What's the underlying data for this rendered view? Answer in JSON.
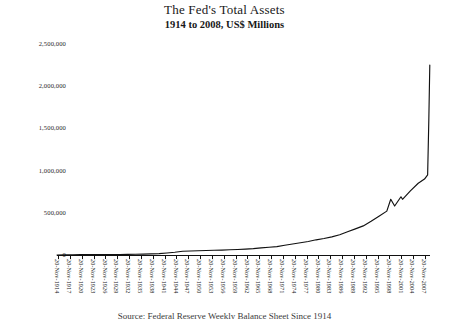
{
  "chart_data": {
    "type": "line",
    "title": "The Fed's Total Assets",
    "subtitle": "1914 to 2008, US$ Millions",
    "xlabel": "",
    "ylabel": "",
    "units": "US$ Millions",
    "grid": false,
    "legend": null,
    "ylim": [
      0,
      2500000
    ],
    "yticks": [
      0,
      500000,
      1000000,
      1500000,
      2000000,
      2500000
    ],
    "ytick_labels": [
      "0",
      "500,000",
      "1,000,000",
      "1,500,000",
      "2,000,000",
      "2,500,000"
    ],
    "xlim": [
      "20-Nov-1914",
      "20-Nov-2008"
    ],
    "xtick_labels": [
      "20-Nov-1914",
      "20-Nov-1917",
      "20-Nov-1920",
      "20-Nov-1923",
      "20-Nov-1926",
      "20-Nov-1929",
      "20-Nov-1932",
      "20-Nov-1935",
      "20-Nov-1938",
      "20-Nov-1941",
      "20-Nov-1944",
      "20-Nov-1947",
      "20-Nov-1950",
      "20-Nov-1953",
      "20-Nov-1956",
      "20-Nov-1959",
      "20-Nov-1962",
      "20-Nov-1965",
      "20-Nov-1968",
      "20-Nov-1971",
      "20-Nov-1974",
      "20-Nov-1977",
      "20-Nov-1980",
      "20-Nov-1983",
      "20-Nov-1986",
      "20-Nov-1989",
      "20-Nov-1992",
      "20-Nov-1995",
      "20-Nov-1998",
      "20-Nov-2001",
      "20-Nov-2004",
      "20-Nov-2007"
    ],
    "series": [
      {
        "name": "Total Assets",
        "color": "#111111",
        "x": [
          1914,
          1916,
          1918,
          1920,
          1922,
          1924,
          1926,
          1928,
          1930,
          1932,
          1934,
          1936,
          1938,
          1940,
          1942,
          1944,
          1946,
          1948,
          1950,
          1952,
          1954,
          1956,
          1958,
          1960,
          1962,
          1964,
          1966,
          1968,
          1970,
          1972,
          1974,
          1976,
          1978,
          1980,
          1982,
          1984,
          1986,
          1988,
          1990,
          1992,
          1994,
          1996,
          1998,
          1999,
          2000,
          2001.6,
          2002,
          2004,
          2006,
          2007.6,
          2008.4,
          2008.7,
          2008.95
        ],
        "values": [
          500,
          1200,
          3500,
          6000,
          5200,
          5500,
          5600,
          5800,
          6000,
          7500,
          9000,
          11000,
          13000,
          17000,
          24000,
          33000,
          45000,
          48000,
          50000,
          53000,
          56000,
          58000,
          62000,
          65000,
          70000,
          76000,
          84000,
          92000,
          100000,
          115000,
          130000,
          145000,
          160000,
          180000,
          195000,
          215000,
          240000,
          275000,
          310000,
          345000,
          400000,
          460000,
          520000,
          660000,
          580000,
          690000,
          660000,
          760000,
          850000,
          900000,
          950000,
          1600000,
          2250000
        ]
      }
    ],
    "annotations": [
      {
        "label": "Y2K liquidity spike",
        "x": 1999,
        "y": 660000
      },
      {
        "label": "Sept 2001 spike",
        "x": 2001.6,
        "y": 690000
      },
      {
        "label": "2008 crisis expansion",
        "x": 2008.95,
        "y": 2250000
      }
    ]
  },
  "footnote": "Source: Federal Reserve Weekly Balance Sheet Since 1914"
}
